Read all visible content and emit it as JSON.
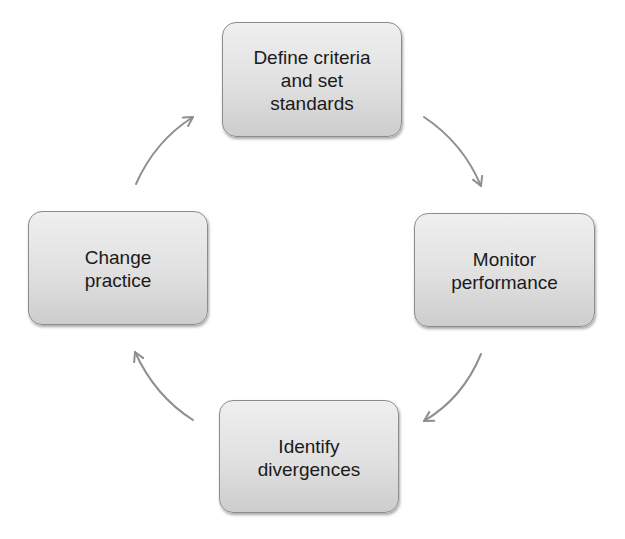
{
  "diagram": {
    "type": "cycle",
    "nodes": [
      {
        "id": "top",
        "label": "Define criteria\nand set\nstandards"
      },
      {
        "id": "right",
        "label": "Monitor\nperformance"
      },
      {
        "id": "bottom",
        "label": "Identify\ndivergences"
      },
      {
        "id": "left",
        "label": "Change\npractice"
      }
    ],
    "edges": [
      {
        "from": "top",
        "to": "right",
        "direction": "clockwise"
      },
      {
        "from": "right",
        "to": "bottom",
        "direction": "clockwise"
      },
      {
        "from": "bottom",
        "to": "left",
        "direction": "clockwise"
      },
      {
        "from": "left",
        "to": "top",
        "direction": "clockwise"
      }
    ],
    "colors": {
      "node_fill_top": "#efefef",
      "node_fill_bottom": "#cdcdcd",
      "node_border": "#8c8c8c",
      "arrow": "#8f8f8f",
      "text": "#1a1a1a"
    }
  }
}
